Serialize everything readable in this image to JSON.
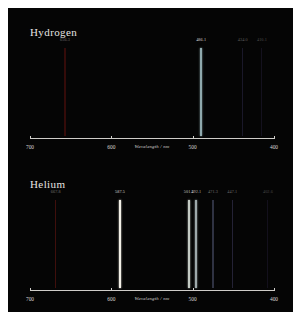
{
  "figure": {
    "background": "#050505",
    "frame_color": "#ffffff"
  },
  "axis": {
    "title": "Wavelength / nm",
    "min_nm": 400,
    "max_nm": 700,
    "reversed": true,
    "ticks": [
      {
        "label": "700",
        "value": 700
      },
      {
        "label": "600",
        "value": 600
      },
      {
        "label": "500",
        "value": 500
      },
      {
        "label": "400",
        "value": 400
      }
    ]
  },
  "chart_data": {
    "type": "line",
    "xlabel": "Wavelength / nm",
    "ylabel": "",
    "xlim": [
      700,
      400
    ],
    "grid": false,
    "legend": "none",
    "series": [
      {
        "name": "Hydrogen",
        "values": [
          {
            "label": "656.3",
            "wavelength": 656.3,
            "color": "#6e1410",
            "width": 1.6,
            "intensity": 0.45
          },
          {
            "label": "486.1",
            "wavelength": 486.1,
            "color": "#8fa9ad",
            "width": 2.6,
            "intensity": 1.0
          },
          {
            "label": "434.0",
            "wavelength": 434.0,
            "color": "#3a3560",
            "width": 1.0,
            "intensity": 0.4
          },
          {
            "label": "410.1",
            "wavelength": 410.1,
            "color": "#332b52",
            "width": 1.0,
            "intensity": 0.33
          }
        ]
      },
      {
        "name": "Helium",
        "values": [
          {
            "label": "667.8",
            "wavelength": 667.8,
            "color": "#7a1a14",
            "width": 1.2,
            "intensity": 0.5
          },
          {
            "label": "587.5",
            "wavelength": 587.5,
            "color": "#f2efe6",
            "width": 2.6,
            "intensity": 1.0
          },
          {
            "label": "501.5",
            "wavelength": 501.5,
            "color": "#cfd6cf",
            "width": 2.2,
            "intensity": 0.95
          },
          {
            "label": "492.1",
            "wavelength": 492.1,
            "color": "#b9c6c9",
            "width": 1.8,
            "intensity": 0.85
          },
          {
            "label": "471.3",
            "wavelength": 471.3,
            "color": "#5a6080",
            "width": 1.2,
            "intensity": 0.5
          },
          {
            "label": "447.1",
            "wavelength": 447.1,
            "color": "#4a4670",
            "width": 1.2,
            "intensity": 0.45
          },
          {
            "label": "402.6",
            "wavelength": 402.6,
            "color": "#332b52",
            "width": 1.0,
            "intensity": 0.3
          }
        ]
      }
    ]
  },
  "panels": [
    {
      "title": "Hydrogen",
      "series_index": 0
    },
    {
      "title": "Helium",
      "series_index": 1
    }
  ]
}
